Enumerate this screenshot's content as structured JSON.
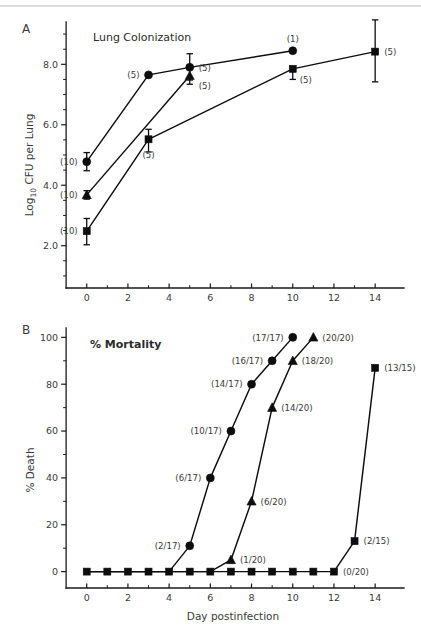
{
  "figure": {
    "panel_a_letter": "A",
    "panel_b_letter": "B",
    "panel_a_title": "Lung Colonization",
    "panel_b_title": "% Mortality",
    "shared_xlabel": "Day postinfection",
    "colors": {
      "ink": "#0d0d0d",
      "axis": "#1a1a1a",
      "text": "#3a3a3a",
      "top_rule": "#b9b9b9",
      "background": "#ffffff"
    }
  },
  "chart_data": [
    {
      "id": "panel_a",
      "type": "line",
      "title": "Lung Colonization",
      "panel": "A",
      "xlabel": "Day postinfection",
      "ylabel": "Log10 CFU per Lung",
      "ylabel_base": "Log",
      "ylabel_sub": "10",
      "ylabel_rest": " CFU per Lung",
      "xlim": [
        -1.2,
        15.4
      ],
      "ylim": [
        0.6,
        9.4
      ],
      "xticks": [
        0,
        2,
        4,
        6,
        8,
        10,
        12,
        14
      ],
      "xtick_labels": [
        "0",
        "2",
        "4",
        "6",
        "8",
        "10",
        "12",
        "14"
      ],
      "yticks": [
        2.0,
        4.0,
        6.0,
        8.0
      ],
      "ytick_labels": [
        "2.0",
        "4.0",
        "6.0",
        "8.0"
      ],
      "y_minor_step": 0.5,
      "grid": false,
      "legend": "none",
      "series": [
        {
          "name": "circle-series",
          "marker": "circle",
          "x": [
            0,
            3,
            5,
            10
          ],
          "values": [
            4.78,
            7.65,
            7.9,
            8.45
          ],
          "err_low": [
            0.3,
            0.0,
            0.42,
            0.0
          ],
          "err_high": [
            0.3,
            0.0,
            0.45,
            0.0
          ],
          "annotations": [
            "(10)",
            "(5)",
            "(5)",
            "(1)"
          ],
          "annot_pos": [
            "left",
            "left",
            "right",
            "above"
          ]
        },
        {
          "name": "triangle-series",
          "marker": "triangle",
          "x": [
            0,
            5
          ],
          "values": [
            3.68,
            7.62
          ],
          "err_low": [
            0.14,
            0.28
          ],
          "err_high": [
            0.14,
            0.0
          ],
          "annotations": [
            "(10)",
            "(5)"
          ],
          "annot_pos": [
            "left",
            "right-below"
          ]
        },
        {
          "name": "square-series",
          "marker": "square",
          "x": [
            0,
            3,
            10,
            14
          ],
          "values": [
            2.48,
            5.52,
            7.85,
            8.42
          ],
          "err_low": [
            0.45,
            0.42,
            0.35,
            1.0
          ],
          "err_high": [
            0.42,
            0.33,
            0.0,
            1.05
          ],
          "annotations": [
            "(10)",
            "(5)",
            "(5)",
            "(5)"
          ],
          "annot_pos": [
            "left",
            "below",
            "below-right",
            "right"
          ]
        }
      ]
    },
    {
      "id": "panel_b",
      "type": "line",
      "title": "% Mortality",
      "panel": "B",
      "xlabel": "Day postinfection",
      "ylabel": "% Death",
      "xlim": [
        -1.2,
        15.4
      ],
      "ylim": [
        -7,
        104
      ],
      "xticks": [
        0,
        2,
        4,
        6,
        8,
        10,
        12,
        14
      ],
      "xtick_labels": [
        "0",
        "2",
        "4",
        "6",
        "8",
        "10",
        "12",
        "14"
      ],
      "yticks": [
        0,
        20,
        40,
        60,
        80,
        100
      ],
      "ytick_labels": [
        "0",
        "20",
        "40",
        "60",
        "80",
        "100"
      ],
      "y_minor_step": 10,
      "grid": false,
      "legend": "none",
      "series": [
        {
          "name": "circle-series",
          "marker": "circle",
          "x": [
            0,
            1,
            2,
            3,
            4,
            5,
            6,
            7,
            8,
            9,
            10
          ],
          "values": [
            0,
            0,
            0,
            0,
            0,
            11,
            40,
            60,
            80,
            90,
            100
          ],
          "annotations": [
            "",
            "",
            "",
            "",
            "",
            "(2/17)",
            "(6/17)",
            "(10/17)",
            "(14/17)",
            "(16/17)",
            "(17/17)"
          ],
          "annot_pos": [
            "",
            "",
            "",
            "",
            "",
            "left",
            "left",
            "left",
            "left",
            "left",
            "left"
          ],
          "markers_visible": [
            false,
            false,
            false,
            false,
            false,
            true,
            true,
            true,
            true,
            true,
            true
          ]
        },
        {
          "name": "triangle-series",
          "marker": "triangle",
          "x": [
            0,
            1,
            2,
            3,
            4,
            5,
            6,
            7,
            8,
            9,
            10,
            11
          ],
          "values": [
            0,
            0,
            0,
            0,
            0,
            0,
            0,
            5,
            30,
            70,
            90,
            100
          ],
          "annotations": [
            "",
            "",
            "",
            "",
            "",
            "",
            "",
            "(1/20)",
            "(6/20)",
            "(14/20)",
            "(18/20)",
            "(20/20)"
          ],
          "annot_pos": [
            "",
            "",
            "",
            "",
            "",
            "",
            "",
            "right",
            "right",
            "right",
            "right",
            "right"
          ],
          "markers_visible": [
            false,
            false,
            false,
            false,
            false,
            false,
            false,
            true,
            true,
            true,
            true,
            true
          ]
        },
        {
          "name": "square-series",
          "marker": "square",
          "x": [
            0,
            1,
            2,
            3,
            4,
            5,
            6,
            7,
            8,
            9,
            10,
            11,
            12,
            13,
            14
          ],
          "values": [
            0,
            0,
            0,
            0,
            0,
            0,
            0,
            0,
            0,
            0,
            0,
            0,
            0,
            13,
            87
          ],
          "annotations": [
            "",
            "",
            "",
            "",
            "",
            "",
            "",
            "",
            "",
            "",
            "",
            "",
            "(0/20)",
            "(2/15)",
            "(13/15)"
          ],
          "annot_pos": [
            "",
            "",
            "",
            "",
            "",
            "",
            "",
            "",
            "",
            "",
            "",
            "",
            "right",
            "right",
            "right"
          ],
          "markers_visible": [
            true,
            true,
            true,
            true,
            true,
            true,
            true,
            true,
            true,
            true,
            true,
            true,
            true,
            true,
            true
          ]
        }
      ]
    }
  ]
}
